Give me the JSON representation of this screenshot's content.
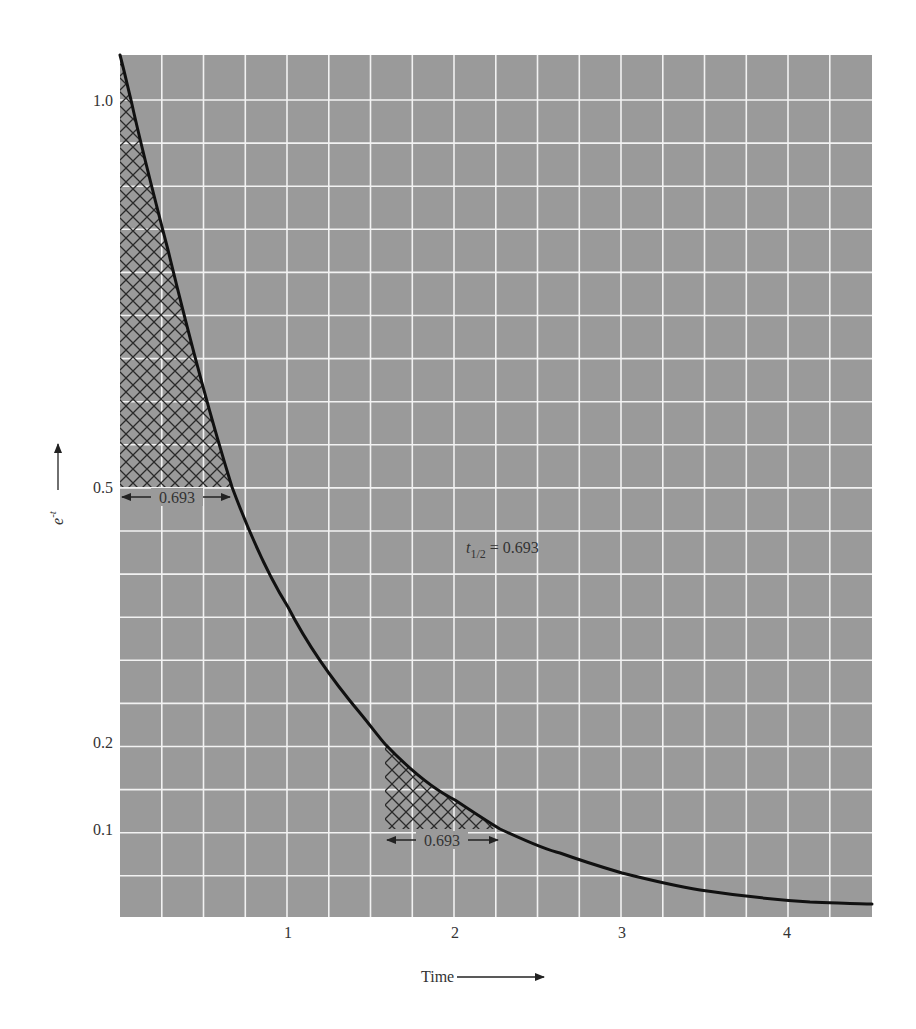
{
  "chart_data": {
    "type": "line",
    "title": "",
    "xlabel": "Time",
    "ylabel": "e^-t",
    "xlim": [
      0,
      4.5
    ],
    "x_ticks": [
      1,
      2,
      3,
      4
    ],
    "x_tick_labels": [
      "1",
      "2",
      "3",
      "4"
    ],
    "y_ticks": [
      1.0,
      0.5,
      0.2,
      0.1
    ],
    "y_tick_labels": [
      "1.0",
      "0.5",
      "0.2",
      "0.1"
    ],
    "grid": true,
    "grid_minor_x_step": 0.25,
    "series": [
      {
        "name": "e^-t",
        "x": [
          0,
          0.25,
          0.5,
          0.693,
          1.0,
          1.5,
          2.0,
          2.5,
          3.0,
          3.5,
          4.0,
          4.5
        ],
        "values": [
          1.0,
          0.779,
          0.607,
          0.5,
          0.368,
          0.223,
          0.135,
          0.082,
          0.05,
          0.03,
          0.018,
          0.011
        ]
      }
    ],
    "annotations": [
      {
        "text": "t1/2 = 0.693",
        "label_main": "t",
        "label_sub": "1/2",
        "label_rest": " = 0.693"
      },
      {
        "text": "0.693",
        "type": "interval",
        "from_x": 0,
        "to_x": 0.693,
        "at_y": 0.5,
        "hatched_region": "e^-t from 1.0 to 0.5"
      },
      {
        "text": "0.693",
        "type": "interval",
        "from_x": 1.609,
        "to_x": 2.303,
        "at_y": 0.1,
        "hatched_region": "e^-t from 0.2 to 0.1"
      }
    ],
    "colors": {
      "plot_background": "#9a9a9a",
      "grid": "#f2f2f2",
      "curve": "#111111",
      "hatch": "#2a2a2a"
    }
  },
  "labels": {
    "x_axis_title": "Time",
    "y_axis_title_base": "e",
    "y_axis_title_exp": "-t",
    "half_life_main": "t",
    "half_life_sub": "1/2",
    "half_life_rest": " = 0.693",
    "interval_1": "0.693",
    "interval_2": "0.693",
    "x_tick_1": "1",
    "x_tick_2": "2",
    "x_tick_3": "3",
    "x_tick_4": "4",
    "y_tick_10": "1.0",
    "y_tick_05": "0.5",
    "y_tick_02": "0.2",
    "y_tick_01": "0.1"
  }
}
